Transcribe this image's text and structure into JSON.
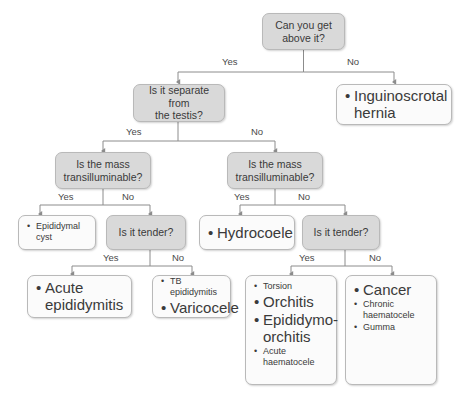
{
  "diagram": {
    "colors": {
      "decision_fill": "#d9d9d9",
      "outcome_fill": "#fbfbfb",
      "border": "#b9b9b9",
      "text": "#3a3a3a",
      "connector": "#8c8c8c",
      "background": "#ffffff"
    },
    "edge_labels": {
      "yes": "Yes",
      "no": "No"
    }
  },
  "nodes": {
    "q_above": {
      "type": "decision",
      "line1": "Can you get",
      "line2": "above it?"
    },
    "q_separate": {
      "type": "decision",
      "line1": "Is it separate from",
      "line2": "the testis?"
    },
    "hernia": {
      "type": "outcome",
      "items": [
        {
          "text": "Inguinoscrotal hernia",
          "size": "big"
        }
      ]
    },
    "q_translum_left": {
      "type": "decision",
      "line1": "Is the mass",
      "line2": "transilluminable?"
    },
    "q_translum_right": {
      "type": "decision",
      "line1": "Is the mass",
      "line2": "transilluminable?"
    },
    "epididymal_cyst": {
      "type": "outcome",
      "items": [
        {
          "text": "Epididymal cyst",
          "size": "small"
        }
      ]
    },
    "q_tender_left": {
      "type": "decision",
      "line1": "Is it tender?",
      "line2": ""
    },
    "hydrocoele": {
      "type": "outcome",
      "items": [
        {
          "text": "Hydrocoele",
          "size": "big"
        }
      ]
    },
    "q_tender_right": {
      "type": "decision",
      "line1": "Is it tender?",
      "line2": ""
    },
    "acute_epididymitis": {
      "type": "outcome",
      "items": [
        {
          "text": "Acute epididymitis",
          "size": "big"
        }
      ]
    },
    "varicocele": {
      "type": "outcome",
      "items": [
        {
          "text": "TB epididymitis",
          "size": "small"
        },
        {
          "text": "Varicocele",
          "size": "big"
        }
      ]
    },
    "torsion_group": {
      "type": "outcome",
      "items": [
        {
          "text": "Torsion",
          "size": "small"
        },
        {
          "text": "Orchitis",
          "size": "big"
        },
        {
          "text": "Epididymo-orchitis",
          "size": "big"
        },
        {
          "text": "Acute haematocele",
          "size": "small"
        }
      ]
    },
    "cancer_group": {
      "type": "outcome",
      "items": [
        {
          "text": "Cancer",
          "size": "big"
        },
        {
          "text": "Chronic haematocele",
          "size": "small"
        },
        {
          "text": "Gumma",
          "size": "small"
        }
      ]
    }
  },
  "edges": [
    {
      "from": "q_above",
      "to": "q_separate",
      "label": "Yes"
    },
    {
      "from": "q_above",
      "to": "hernia",
      "label": "No"
    },
    {
      "from": "q_separate",
      "to": "q_translum_left",
      "label": "Yes"
    },
    {
      "from": "q_separate",
      "to": "q_translum_right",
      "label": "No"
    },
    {
      "from": "q_translum_left",
      "to": "epididymal_cyst",
      "label": "Yes"
    },
    {
      "from": "q_translum_left",
      "to": "q_tender_left",
      "label": "No"
    },
    {
      "from": "q_translum_right",
      "to": "hydrocoele",
      "label": "Yes"
    },
    {
      "from": "q_translum_right",
      "to": "q_tender_right",
      "label": "No"
    },
    {
      "from": "q_tender_left",
      "to": "acute_epididymitis",
      "label": "Yes"
    },
    {
      "from": "q_tender_left",
      "to": "varicocele",
      "label": "No"
    },
    {
      "from": "q_tender_right",
      "to": "torsion_group",
      "label": "Yes"
    },
    {
      "from": "q_tender_right",
      "to": "cancer_group",
      "label": "No"
    }
  ]
}
